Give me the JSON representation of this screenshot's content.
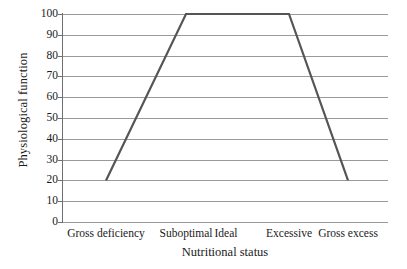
{
  "chart_data": {
    "type": "line",
    "title": "",
    "xlabel": "Nutritional status",
    "ylabel": "Physiological function",
    "categories": [
      "Gross deficiency",
      "Suboptimal",
      "Ideal",
      "Excessive",
      "Gross excess"
    ],
    "x": [
      "Gross deficiency",
      "Suboptimal",
      "Ideal",
      "Excessive",
      "Gross excess"
    ],
    "values": [
      20,
      100,
      100,
      100,
      20
    ],
    "series": [
      {
        "name": "Physiological function",
        "points": [
          {
            "x": "Gross deficiency",
            "y": 20
          },
          {
            "x": "Suboptimal",
            "y": 100
          },
          {
            "x": "Ideal",
            "y": 100
          },
          {
            "x": "Excessive",
            "y": 100
          },
          {
            "x": "Gross excess",
            "y": 20
          }
        ],
        "values": [
          20,
          100,
          100,
          100,
          20
        ],
        "color": "#555555"
      }
    ],
    "ylim": [
      0,
      100
    ],
    "yticks": [
      0,
      10,
      20,
      30,
      40,
      50,
      60,
      70,
      80,
      90,
      100
    ],
    "ytick_labels": [
      "0",
      "10",
      "20",
      "30",
      "40",
      "50",
      "60",
      "70",
      "80",
      "90",
      "100"
    ],
    "grid": "horizontal",
    "legend": "none",
    "line_color": "#555555",
    "grid_color": "#9a9a9a",
    "axis_color": "#6f6f6f"
  }
}
